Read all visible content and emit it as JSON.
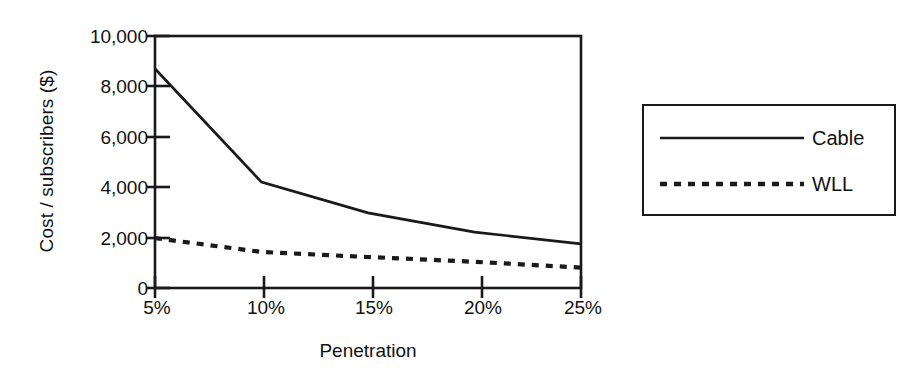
{
  "chart_data": {
    "type": "line",
    "title": "",
    "xlabel": "Penetration",
    "ylabel": "Cost / subscribers ($)",
    "x": [
      5,
      10,
      15,
      20,
      25
    ],
    "categories": [
      "5%",
      "10%",
      "15%",
      "20%",
      "25%"
    ],
    "xtick_labels": [
      "5%",
      "10%",
      "15%",
      "20%",
      "25%"
    ],
    "ytick_labels": [
      "10,000",
      "8,000",
      "6,000",
      "4,000",
      "2,000",
      "0"
    ],
    "yticks": [
      10000,
      8000,
      6000,
      4000,
      2000,
      0
    ],
    "xlim": [
      5,
      25
    ],
    "ylim": [
      0,
      10000
    ],
    "grid": false,
    "legend_position": "right-outside",
    "series": [
      {
        "name": "Cable",
        "style": "solid",
        "color": "#1a1a1a",
        "values": [
          8700,
          4200,
          2980,
          2220,
          1750
        ]
      },
      {
        "name": "WLL",
        "style": "dotted",
        "color": "#1a1a1a",
        "values": [
          1980,
          1430,
          1230,
          1040,
          810
        ]
      }
    ]
  },
  "legend": {
    "items": [
      {
        "label": "Cable",
        "style": "solid"
      },
      {
        "label": "WLL",
        "style": "dotted"
      }
    ]
  },
  "colors": {
    "ink": "#1a1a1a",
    "background": "#ffffff"
  }
}
